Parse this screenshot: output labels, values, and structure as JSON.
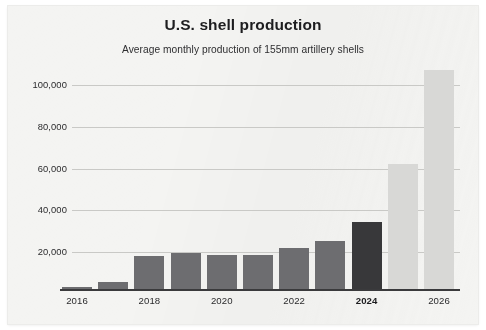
{
  "chart_data": {
    "type": "bar",
    "title": "U.S. shell production",
    "subtitle": "Average monthly production of 155mm artillery shells",
    "xlabel": "",
    "ylabel": "",
    "categories": [
      2016,
      2017,
      2018,
      2019,
      2020,
      2021,
      2022,
      2023,
      2024,
      2025,
      2026
    ],
    "values": [
      2000,
      5500,
      18000,
      19500,
      18500,
      18500,
      22000,
      25500,
      34500,
      62000,
      107000
    ],
    "series": [
      {
        "name": "Average monthly production of 155mm artillery shells",
        "values": [
          2000,
          5500,
          18000,
          19500,
          18500,
          18500,
          22000,
          25500,
          34500,
          62000,
          107000
        ]
      }
    ],
    "ylim": [
      0,
      105000
    ],
    "ytick_values": [
      20000,
      40000,
      60000,
      80000,
      100000
    ],
    "ytick_labels": [
      "20,000",
      "40,000",
      "60,000",
      "80,000",
      "100,000"
    ],
    "xtick_labels": [
      "2016",
      "2018",
      "2020",
      "2022",
      "2024",
      "2026"
    ],
    "xtick_bold": [
      "2024"
    ],
    "grid": "horizontal",
    "legend": "none",
    "bar_styles": [
      "actual",
      "actual",
      "actual",
      "actual",
      "actual",
      "actual",
      "actual",
      "actual",
      "highlight",
      "projected",
      "projected"
    ],
    "colors": {
      "bar_actual": "#6d6d70",
      "bar_highlight": "#38383a",
      "bar_projected": "#d8d8d6",
      "gridline": "#c9c9c6",
      "axis": "#3a3a3c",
      "background": "#f4f4f2",
      "title_text": "#1d1d1f",
      "tick_text": "#2b2b2d"
    }
  }
}
